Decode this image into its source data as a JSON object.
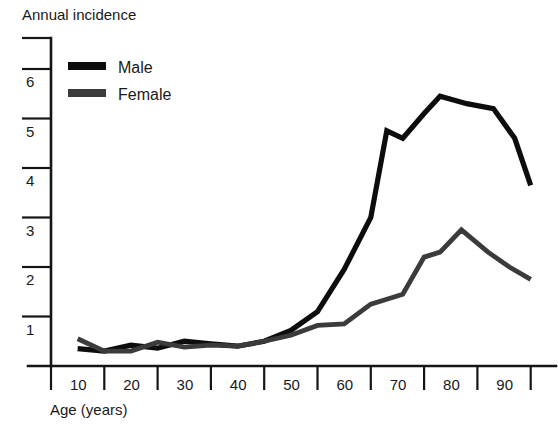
{
  "chart_data": {
    "type": "line",
    "title": "",
    "ylabel": "Annual incidence",
    "xlabel": "Age (years)",
    "xlim": [
      0,
      92
    ],
    "ylim": [
      0,
      6.35
    ],
    "grid": false,
    "legend_position": "top-left inside plot",
    "y_ticks": [
      1,
      2,
      3,
      4,
      5,
      6
    ],
    "y_tick_labels": [
      "1",
      "2",
      "3",
      "4",
      "5",
      "6"
    ],
    "x_ticks": [
      0,
      10,
      20,
      30,
      40,
      50,
      60,
      70,
      80,
      90
    ],
    "x_tick_labels": [
      "10",
      "20",
      "30",
      "40",
      "50",
      "60",
      "70",
      "80",
      "90"
    ],
    "series": [
      {
        "name": "Male",
        "color": "#0d0d0d",
        "x": [
          5,
          10,
          15,
          20,
          25,
          30,
          35,
          40,
          45,
          50,
          55,
          60,
          63,
          66,
          70,
          73,
          78,
          83,
          87,
          90
        ],
        "values": [
          0.35,
          0.3,
          0.42,
          0.36,
          0.5,
          0.45,
          0.4,
          0.5,
          0.72,
          1.1,
          1.95,
          3.0,
          4.75,
          4.6,
          5.1,
          5.45,
          5.3,
          5.2,
          4.6,
          3.65
        ]
      },
      {
        "name": "Female",
        "color": "#3b3b3b",
        "x": [
          5,
          10,
          15,
          20,
          25,
          30,
          35,
          40,
          45,
          50,
          55,
          60,
          63,
          66,
          70,
          73,
          77,
          82,
          86,
          90
        ],
        "values": [
          0.55,
          0.3,
          0.3,
          0.48,
          0.38,
          0.42,
          0.4,
          0.5,
          0.62,
          0.82,
          0.85,
          1.25,
          1.35,
          1.45,
          2.2,
          2.3,
          2.75,
          2.3,
          2.0,
          1.75
        ]
      }
    ],
    "legend": [
      {
        "label": "Male",
        "color": "#0d0d0d"
      },
      {
        "label": "Female",
        "color": "#3b3b3b"
      }
    ]
  },
  "axis": {
    "y_title": "Annual incidence",
    "x_title": "Age (years)"
  }
}
